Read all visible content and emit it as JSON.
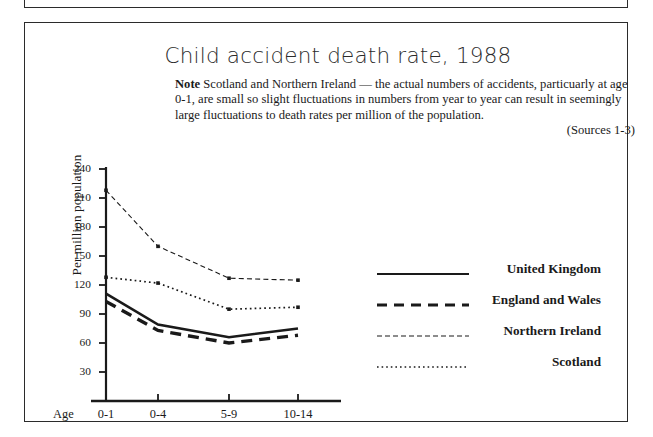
{
  "figure": {
    "title": "Child accident death rate, 1988",
    "note_label": "Note",
    "note_text": " Scotland and Northern Ireland — the actual numbers of accidents, particuarly at age 0-1, are small so slight fluctuations in numbers from year to year can result in seemingly large fluctuations to death rates per million of the population.",
    "sources": "(Sources  1-3)"
  },
  "axis": {
    "x_title": "Age",
    "y_title": "Per million population"
  },
  "legend": {
    "items": [
      {
        "label": "United Kingdom",
        "style": "solid"
      },
      {
        "label": "England and Wales",
        "style": "dashed"
      },
      {
        "label": "Northern Ireland",
        "style": "fine-dashed"
      },
      {
        "label": "Scotland",
        "style": "dotted"
      }
    ]
  },
  "chart_data": {
    "type": "line",
    "title": "Child accident death rate, 1988",
    "xlabel": "Age",
    "ylabel": "Per million population",
    "categories": [
      "0-1",
      "0-4",
      "5-9",
      "10-14"
    ],
    "ylim": [
      0,
      240
    ],
    "yticks": [
      30,
      60,
      90,
      120,
      150,
      180,
      210,
      240
    ],
    "grid": false,
    "legend_position": "right",
    "series": [
      {
        "name": "United Kingdom",
        "style": "solid",
        "values": [
          111,
          79,
          66,
          75
        ]
      },
      {
        "name": "England and Wales",
        "style": "dashed",
        "values": [
          103,
          73,
          60,
          68
        ]
      },
      {
        "name": "Northern Ireland",
        "style": "fine-dashed",
        "values": [
          218,
          160,
          127,
          125
        ]
      },
      {
        "name": "Scotland",
        "style": "dotted",
        "values": [
          128,
          122,
          95,
          97
        ]
      }
    ]
  }
}
